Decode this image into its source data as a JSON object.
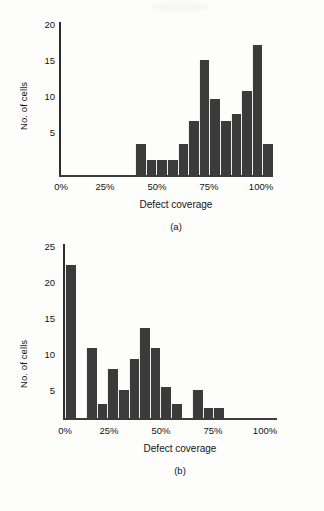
{
  "figure": {
    "panels": [
      {
        "id": "a",
        "letter": "(a)",
        "ylabel": "No. of cells",
        "xlabel": "Defect coverage",
        "yticks": [
          "20",
          "15",
          "10",
          "5"
        ],
        "xticks": [
          "0%",
          "25%",
          "50%",
          "75%",
          "100%"
        ]
      },
      {
        "id": "b",
        "letter": "(b)",
        "ylabel": "No. of cells",
        "xlabel": "Defect coverage",
        "yticks": [
          "25",
          "20",
          "15",
          "10",
          "5"
        ],
        "xticks": [
          "0%",
          "25%",
          "50%",
          "75%",
          "100%"
        ]
      }
    ]
  },
  "colors": {
    "bar": "#3b3b3b",
    "axis": "#2d2d2d",
    "background": "#fdfdfb",
    "text": "#141414"
  },
  "chart_data": [
    {
      "type": "bar",
      "title": "(a)",
      "xlabel": "Defect coverage",
      "ylabel": "No. of cells",
      "xlim": [
        0,
        100
      ],
      "ylim": [
        0,
        20
      ],
      "yticks": [
        5,
        10,
        15,
        20
      ],
      "xticks": [
        0,
        25,
        50,
        75,
        100
      ],
      "grid": false,
      "legend": null,
      "bin_width": 5,
      "bin_starts": [
        35,
        40,
        45,
        50,
        55,
        60,
        65,
        70,
        75,
        80,
        85,
        90,
        95
      ],
      "categories": [
        "35-40%",
        "40-45%",
        "45-50%",
        "50-55%",
        "55-60%",
        "60-65%",
        "65-70%",
        "70-75%",
        "75-80%",
        "80-85%",
        "85-90%",
        "90-95%",
        "95-100%"
      ],
      "values": [
        4,
        2,
        2,
        2,
        4,
        7,
        15,
        10,
        7,
        8,
        11,
        17,
        4
      ]
    },
    {
      "type": "bar",
      "title": "(b)",
      "xlabel": "Defect coverage",
      "ylabel": "No. of cells",
      "xlim": [
        0,
        100
      ],
      "ylim": [
        0,
        25
      ],
      "yticks": [
        5,
        10,
        15,
        20,
        25
      ],
      "xticks": [
        0,
        25,
        50,
        75,
        100
      ],
      "grid": false,
      "legend": null,
      "bin_width": 5,
      "bin_starts": [
        0,
        10,
        15,
        20,
        25,
        30,
        35,
        40,
        45,
        50,
        60,
        65,
        70
      ],
      "categories": [
        "0-5%",
        "10-15%",
        "15-20%",
        "20-25%",
        "25-30%",
        "30-35%",
        "35-40%",
        "40-45%",
        "45-50%",
        "50-55%",
        "60-65%",
        "65-70%",
        "70-75%"
      ],
      "values": [
        22,
        10,
        2,
        7,
        4,
        8.5,
        13,
        10,
        4.5,
        2,
        4,
        1.5,
        1.5
      ]
    }
  ]
}
